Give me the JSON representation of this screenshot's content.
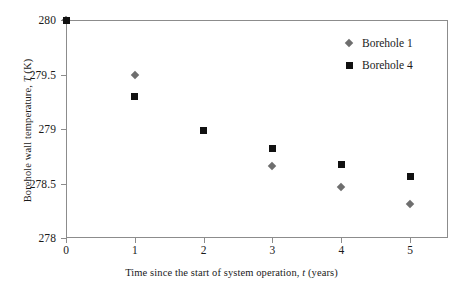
{
  "chart_data": {
    "type": "scatter",
    "title": "",
    "xlabel": "Time since the start of system operation, t (years)",
    "ylabel": "Borehole wall temperature, T (K)",
    "xlim": [
      0,
      5.55
    ],
    "ylim": [
      278,
      280
    ],
    "xticks": [
      0,
      1,
      2,
      3,
      4,
      5
    ],
    "xtick_labels": [
      "0",
      "1",
      "2",
      "3",
      "4",
      "5"
    ],
    "yticks": [
      278,
      278.5,
      279,
      279.5,
      280
    ],
    "ytick_labels": [
      "278",
      "278.5",
      "279",
      "279.5",
      "280"
    ],
    "grid": false,
    "legend_position": "top-right",
    "series": [
      {
        "name": "Borehole 1",
        "marker": "diamond",
        "color": "#6e6e6e",
        "x": [
          0,
          1,
          3,
          4,
          5
        ],
        "y": [
          280,
          279.5,
          278.66,
          278.47,
          278.31
        ]
      },
      {
        "name": "Borehole 4",
        "marker": "square",
        "color": "#111111",
        "x": [
          0,
          1,
          2,
          3,
          4,
          5
        ],
        "y": [
          280,
          279.3,
          278.99,
          278.82,
          278.67,
          278.56
        ]
      }
    ]
  },
  "axis": {
    "x_title_prefix": "Time since the start of system operation, ",
    "x_title_italic": "t",
    "x_title_suffix": " (years)",
    "y_title_prefix": "Borehole wall temperature, ",
    "y_title_italic": "T",
    "y_title_suffix": " (K)"
  }
}
